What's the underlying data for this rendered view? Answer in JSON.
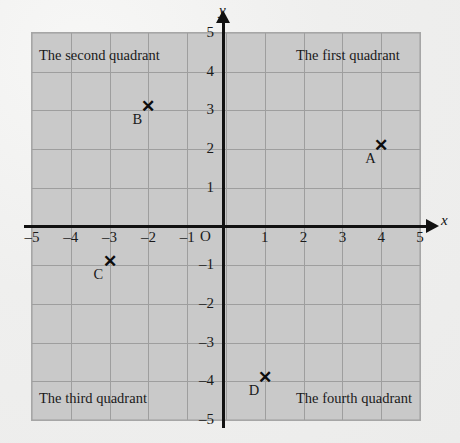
{
  "figure": {
    "type": "coordinate-plane",
    "background_color": "#efefee",
    "plot_fill_color": "#c9c9c9",
    "grid_color": "#9e9e9e",
    "axis_color": "#111111"
  },
  "axes": {
    "x_label": "x",
    "y_label": "y",
    "origin_label": "O",
    "x_ticks": [
      "–5",
      "–4",
      "–3",
      "–2",
      "–1",
      "1",
      "2",
      "3",
      "4",
      "5"
    ],
    "y_ticks": [
      "5",
      "4",
      "3",
      "2",
      "1",
      "–1",
      "–2",
      "–3",
      "–4",
      "–5"
    ],
    "xlim": [
      -5,
      5
    ],
    "ylim": [
      -5,
      5
    ],
    "grid": true
  },
  "quadrants": [
    {
      "name": "first",
      "label": "The first quadrant"
    },
    {
      "name": "second",
      "label": "The second quadrant"
    },
    {
      "name": "third",
      "label": "The third quadrant"
    },
    {
      "name": "fourth",
      "label": "The fourth quadrant"
    }
  ],
  "chart_data": {
    "type": "scatter",
    "title": "",
    "xlabel": "x",
    "ylabel": "y",
    "xlim": [
      -5,
      5
    ],
    "ylim": [
      -5,
      5
    ],
    "grid": true,
    "marker": "x",
    "points": [
      {
        "label": "A",
        "x": 4,
        "y": 2,
        "quadrant": "first"
      },
      {
        "label": "B",
        "x": -2,
        "y": 3,
        "quadrant": "second"
      },
      {
        "label": "C",
        "x": -3,
        "y": -1,
        "quadrant": "third"
      },
      {
        "label": "D",
        "x": 1,
        "y": -4,
        "quadrant": "fourth"
      }
    ],
    "annotations": [
      "The first quadrant",
      "The second quadrant",
      "The third quadrant",
      "The fourth quadrant"
    ]
  }
}
